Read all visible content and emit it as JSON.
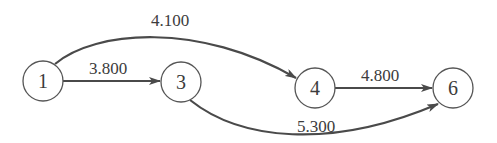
{
  "diagram": {
    "type": "directed-weighted-graph",
    "colors": {
      "edge": "#4a4a4a",
      "node_stroke": "#555555",
      "text": "#3c3c3c",
      "background": "#ffffff"
    },
    "nodes": [
      {
        "id": "1",
        "label": "1"
      },
      {
        "id": "3",
        "label": "3"
      },
      {
        "id": "4",
        "label": "4"
      },
      {
        "id": "6",
        "label": "6"
      }
    ],
    "edges": [
      {
        "from": "1",
        "to": "3",
        "weight": "3.800"
      },
      {
        "from": "1",
        "to": "4",
        "weight": "4.100"
      },
      {
        "from": "4",
        "to": "6",
        "weight": "4.800"
      },
      {
        "from": "3",
        "to": "6",
        "weight": "5.300"
      }
    ]
  }
}
